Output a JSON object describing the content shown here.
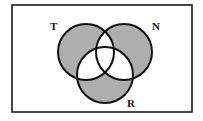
{
  "figure": {
    "kind": "venn-diagram",
    "canvas": {
      "width": 203,
      "height": 121
    },
    "universe": {
      "name": "universal-set-rectangle",
      "x": 12,
      "y": 5,
      "width": 180,
      "height": 107,
      "stroke": "#1a1a1a",
      "stroke_width": 1.6,
      "fill": "#ffffff"
    },
    "style": {
      "shaded_fill": "#aeaeae",
      "unshaded_fill": "#ffffff",
      "outline": "#111111",
      "outline_width": 2,
      "label_color": "#1a1a1a"
    },
    "sets": [
      {
        "id": "T",
        "label": "T",
        "circle": {
          "cx": 86,
          "cy": 52,
          "r": 28
        },
        "label_pos": {
          "x": 50,
          "y": 30
        },
        "label_anchor": "start",
        "exclusive_region_shaded": true
      },
      {
        "id": "N",
        "label": "N",
        "circle": {
          "cx": 124,
          "cy": 52,
          "r": 28
        },
        "label_pos": {
          "x": 152,
          "y": 30
        },
        "label_anchor": "start",
        "exclusive_region_shaded": true
      },
      {
        "id": "R",
        "label": "R",
        "circle": {
          "cx": 105,
          "cy": 75,
          "r": 28
        },
        "label_pos": {
          "x": 127,
          "y": 107
        },
        "label_anchor": "start",
        "exclusive_region_shaded": true
      }
    ],
    "regions": [
      {
        "id": "T-only",
        "sets": [
          "T"
        ],
        "shaded": true
      },
      {
        "id": "N-only",
        "sets": [
          "N"
        ],
        "shaded": true
      },
      {
        "id": "R-only",
        "sets": [
          "R"
        ],
        "shaded": true
      },
      {
        "id": "T-and-N",
        "sets": [
          "T",
          "N"
        ],
        "shaded": false
      },
      {
        "id": "T-and-R",
        "sets": [
          "T",
          "R"
        ],
        "shaded": false
      },
      {
        "id": "N-and-R",
        "sets": [
          "N",
          "R"
        ],
        "shaded": false
      },
      {
        "id": "T-N-R",
        "sets": [
          "T",
          "N",
          "R"
        ],
        "shaded": false
      },
      {
        "id": "outside",
        "sets": [],
        "shaded": false
      }
    ]
  }
}
